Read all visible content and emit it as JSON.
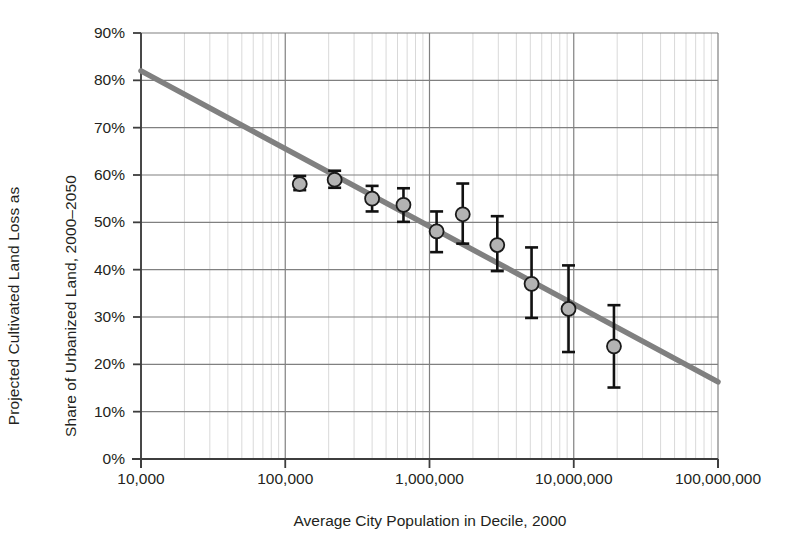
{
  "chart_data": {
    "type": "scatter",
    "title": "",
    "xlabel": "Average City Population in Decile, 2000",
    "ylabel_line1": "Projected Cultivated Land Loss as",
    "ylabel_line2": "Share of Urbanized Land, 2000–2050",
    "xscale": "log",
    "xlim": [
      10000,
      100000000
    ],
    "ylim": [
      0,
      0.9
    ],
    "grid": true,
    "minor_grid": true,
    "legend": "none",
    "xticks": [
      10000,
      100000,
      1000000,
      10000000,
      100000000
    ],
    "xtick_labels": [
      "10,000",
      "100,000",
      "1,000,000",
      "10,000,000",
      "100,000,000"
    ],
    "yticks": [
      0,
      0.1,
      0.2,
      0.3,
      0.4,
      0.5,
      0.6,
      0.7,
      0.8,
      0.9
    ],
    "ytick_labels": [
      "0%",
      "10%",
      "20%",
      "30%",
      "40%",
      "50%",
      "60%",
      "70%",
      "80%",
      "90%"
    ],
    "marker_face_color": "#b3b3b3",
    "marker_edge_color": "#1a1a1a",
    "errorbar_color": "#111111",
    "trendline_color": "#808080",
    "points": [
      {
        "x": 126000,
        "y": 58.1,
        "y_low": 56.8,
        "y_high": 59.8
      },
      {
        "x": 220000,
        "y": 59.0,
        "y_low": 57.3,
        "y_high": 60.9
      },
      {
        "x": 400000,
        "y": 55.0,
        "y_low": 52.3,
        "y_high": 57.7
      },
      {
        "x": 660000,
        "y": 53.7,
        "y_low": 50.1,
        "y_high": 57.2
      },
      {
        "x": 1120000,
        "y": 48.1,
        "y_low": 43.7,
        "y_high": 52.3
      },
      {
        "x": 1700000,
        "y": 51.7,
        "y_low": 45.5,
        "y_high": 58.2
      },
      {
        "x": 2950000,
        "y": 45.2,
        "y_low": 39.7,
        "y_high": 51.3
      },
      {
        "x": 5100000,
        "y": 37.0,
        "y_low": 29.8,
        "y_high": 44.7
      },
      {
        "x": 9200000,
        "y": 31.7,
        "y_low": 22.6,
        "y_high": 40.9
      },
      {
        "x": 19000000,
        "y": 23.8,
        "y_low": 15.1,
        "y_high": 32.5
      }
    ],
    "trendline": {
      "x_start": 10000,
      "y_start": 82.0,
      "x_end": 100000000,
      "y_end": 16.3,
      "slope_per_decade": -16.4
    }
  }
}
